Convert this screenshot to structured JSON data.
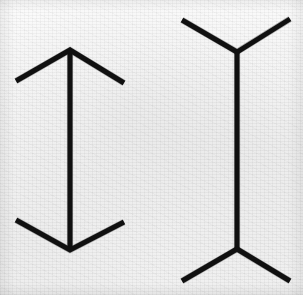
{
  "figure": {
    "title": "Muller-Lyer illusion",
    "background_color": "#f3f3f3",
    "line_color": "#101010",
    "line_width": 5,
    "canvas": {
      "width": 303,
      "height": 295
    }
  },
  "chart_data": {
    "type": "line",
    "title": "Muller-Lyer illusion",
    "xlabel": "",
    "ylabel": "",
    "grid": false,
    "legend": "none",
    "xlim": [
      0,
      303
    ],
    "ylim": [
      0,
      295
    ],
    "series": [
      {
        "name": "left-figure-shaft",
        "points": [
          [
            70,
            50
          ],
          [
            70,
            250
          ]
        ],
        "shaft_length": 200
      },
      {
        "name": "left-figure-top-fins-inward",
        "points": [
          [
            16,
            81
          ],
          [
            70,
            50
          ],
          [
            124,
            83
          ]
        ],
        "fin_direction": "inward"
      },
      {
        "name": "left-figure-bottom-fins-inward",
        "points": [
          [
            16,
            220
          ],
          [
            70,
            250
          ],
          [
            124,
            222
          ]
        ],
        "fin_direction": "inward"
      },
      {
        "name": "right-figure-shaft",
        "points": [
          [
            237,
            52
          ],
          [
            237,
            249
          ]
        ],
        "shaft_length": 197
      },
      {
        "name": "right-figure-top-fins-outward",
        "points": [
          [
            182,
            20
          ],
          [
            237,
            52
          ],
          [
            290,
            19
          ]
        ],
        "fin_direction": "outward"
      },
      {
        "name": "right-figure-bottom-fins-outward",
        "points": [
          [
            182,
            281
          ],
          [
            237,
            249
          ],
          [
            290,
            281
          ]
        ],
        "fin_direction": "outward"
      }
    ],
    "annotations": []
  },
  "left_figure": {
    "name": "arrowheads-inward-figure",
    "shaft": {
      "x": 70,
      "y_top": 50,
      "y_bottom": 250
    },
    "top_fin_left_tip": {
      "x": 16,
      "y": 81
    },
    "top_fin_right_tip": {
      "x": 124,
      "y": 83
    },
    "bottom_fin_left_tip": {
      "x": 16,
      "y": 220
    },
    "bottom_fin_right_tip": {
      "x": 124,
      "y": 222
    }
  },
  "right_figure": {
    "name": "fins-outward-figure",
    "shaft": {
      "x": 237,
      "y_top": 52,
      "y_bottom": 249
    },
    "top_fin_left_tip": {
      "x": 182,
      "y": 20
    },
    "top_fin_right_tip": {
      "x": 290,
      "y": 19
    },
    "bottom_fin_left_tip": {
      "x": 182,
      "y": 281
    },
    "bottom_fin_right_tip": {
      "x": 290,
      "y": 281
    }
  }
}
